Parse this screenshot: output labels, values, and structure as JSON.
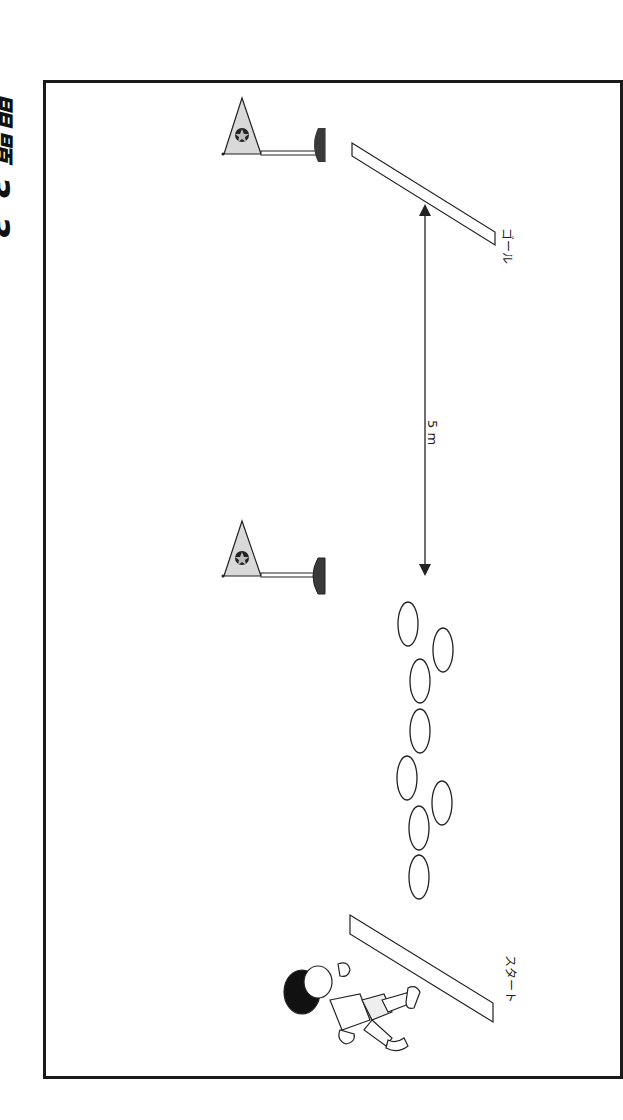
{
  "title": "問題 3 3",
  "labels": {
    "goal": "ゴール",
    "start": "スタート",
    "distance": "5 m"
  },
  "icons": {
    "flag": "flag-icon",
    "star": "star-icon",
    "hoop": "hoop-icon",
    "child": "running-child-icon"
  },
  "colors": {
    "frame": "#1a1a1a",
    "flag_fill": "#d9d9d9",
    "flag_base": "#3a3a3a",
    "line": "#222222"
  },
  "hoops": [
    {
      "cx": 408,
      "cy": 624
    },
    {
      "cx": 443,
      "cy": 650
    },
    {
      "cx": 420,
      "cy": 681
    },
    {
      "cx": 420,
      "cy": 731
    },
    {
      "cx": 407,
      "cy": 778
    },
    {
      "cx": 442,
      "cy": 803
    },
    {
      "cx": 419,
      "cy": 828
    },
    {
      "cx": 419,
      "cy": 877
    }
  ]
}
